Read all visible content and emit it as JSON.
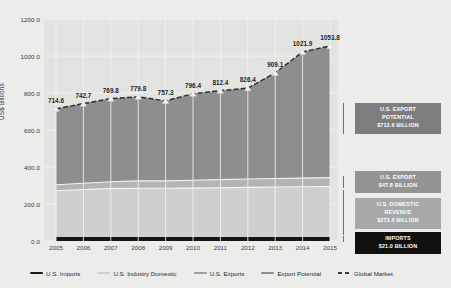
{
  "chart_data": {
    "type": "area",
    "title": "",
    "xlabel": "",
    "ylabel": "US$ Billions",
    "categories": [
      "2005",
      "2006",
      "2007",
      "2008",
      "2009",
      "2010",
      "2011",
      "2012",
      "2013",
      "2014",
      "2015"
    ],
    "ylim": [
      0,
      1200
    ],
    "yticks": [
      "0.0",
      "200.0",
      "400.0",
      "600.0",
      "800.0",
      "1000.0",
      "1200.0"
    ],
    "ytick_values": [
      0,
      200,
      400,
      600,
      800,
      1000,
      1200
    ],
    "grid": true,
    "legend_position": "bottom",
    "data_labels": [
      "714.6",
      "742.7",
      "769.8",
      "779.8",
      "757.3",
      "796.4",
      "812.4",
      "826.4",
      "909.1",
      "1021.9",
      "1053.8"
    ],
    "series": [
      {
        "name": "Global Market",
        "key": "global-market",
        "style": "dashed-line-with-markers",
        "color": "#3b3b3b",
        "values": [
          714.6,
          742.7,
          769.8,
          779.8,
          757.3,
          796.4,
          812.4,
          826.4,
          909.1,
          1021.9,
          1053.8
        ]
      },
      {
        "name": "Export Potential",
        "key": "export-potential",
        "style": "area-band",
        "color": "#8e8e8e",
        "values": [
          410.0,
          437.0,
          463.0,
          473.0,
          450.0,
          487.0,
          502.0,
          515.0,
          597.0,
          708.0,
          741.0
        ]
      },
      {
        "name": "U.S. Exports",
        "key": "us-exports",
        "style": "area-band",
        "color": "#bdbdbd",
        "values": [
          32.0,
          34.0,
          37.0,
          40.0,
          40.0,
          42.0,
          44.0,
          45.0,
          46.0,
          47.0,
          47.8
        ]
      },
      {
        "name": "U.S. Industry Domestic",
        "key": "us-industry-domestic",
        "style": "area-band",
        "color": "#d0d0d0",
        "values": [
          251.0,
          257.0,
          262.0,
          264.0,
          264.0,
          265.0,
          267.0,
          269.0,
          271.0,
          272.0,
          273.6
        ]
      },
      {
        "name": "U.S. Imports",
        "key": "us-imports",
        "style": "area-band",
        "color": "#1a1a1a",
        "values": [
          21.0,
          21.0,
          21.0,
          21.0,
          21.0,
          21.0,
          21.0,
          21.0,
          21.0,
          21.0,
          21.0
        ]
      }
    ],
    "annotations": [
      {
        "id": "export-potential-callout",
        "line1": "U.S. EXPORT",
        "line2": "POTENTIAL",
        "line3": "$712.8 BILLION",
        "background": "#7d7d7d",
        "text_color": "#ffffff"
      },
      {
        "id": "us-export-callout",
        "line1": "U.S. EXPORT",
        "line2": "$47.8 BILLION",
        "line3": "",
        "background": "#949494",
        "text_color": "#ffffff"
      },
      {
        "id": "us-domestic-revenue-callout",
        "line1": "U.S. DOMESTIC",
        "line2": "REVENUE",
        "line3": "$273.6 BILLION",
        "background": "#a8a8a8",
        "text_color": "#ffffff"
      },
      {
        "id": "imports-callout",
        "line1": "IMPORTS",
        "line2": "$21.0 BILLION",
        "line3": "",
        "background": "#101010",
        "text_color": "#ffffff"
      }
    ]
  },
  "legend": {
    "items": [
      {
        "label": "U.S. Imports",
        "color": "#1a1a1a",
        "style": "solid"
      },
      {
        "label": "U.S. Industry Domestic",
        "color": "#d0d0d0",
        "style": "solid"
      },
      {
        "label": "U.S. Exports",
        "color": "#9d9d9d",
        "style": "solid"
      },
      {
        "label": "Export Potential",
        "color": "#8e8e8e",
        "style": "solid"
      },
      {
        "label": "Global Market",
        "color": "#3b3b3b",
        "style": "dashed"
      }
    ]
  }
}
